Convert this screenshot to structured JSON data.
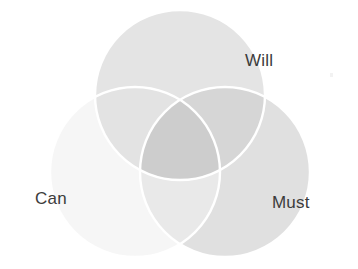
{
  "figure": {
    "kind": "venn-diagram",
    "set_count": 3,
    "background_color": "#ffffff",
    "label_color": "#3c3c3c",
    "separator_color": "#ffffff"
  },
  "chart_data": {
    "type": "venn",
    "title": "",
    "subtitle": "",
    "xlabel": "",
    "ylabel": "",
    "legend_position": "none",
    "grid": false,
    "sets": [
      {
        "id": "will",
        "label": "Will",
        "fill": "#e4e4e4",
        "cx": 180,
        "cy": 95,
        "r": 85,
        "label_position": "top-right"
      },
      {
        "id": "can",
        "label": "Can",
        "fill": "#f6f6f6",
        "cx": 135,
        "cy": 172,
        "r": 85,
        "label_position": "left"
      },
      {
        "id": "must",
        "label": "Must",
        "fill": "#e0e0e0",
        "cx": 225,
        "cy": 172,
        "r": 85,
        "label_position": "right"
      }
    ],
    "regions": [
      {
        "id": "will-only",
        "sets": [
          "Will"
        ],
        "fill": "#e4e4e4"
      },
      {
        "id": "can-only",
        "sets": [
          "Can"
        ],
        "fill": "#f6f6f6"
      },
      {
        "id": "must-only",
        "sets": [
          "Must"
        ],
        "fill": "#e0e0e0"
      },
      {
        "id": "will-can",
        "sets": [
          "Will",
          "Can"
        ],
        "fill": "#e3e3e3"
      },
      {
        "id": "will-must",
        "sets": [
          "Will",
          "Must"
        ],
        "fill": "#d6d6d6"
      },
      {
        "id": "can-must",
        "sets": [
          "Can",
          "Must"
        ],
        "fill": "#e9e9e9"
      },
      {
        "id": "will-can-must",
        "sets": [
          "Will",
          "Can",
          "Must"
        ],
        "fill": "#cdcdcd"
      }
    ]
  },
  "labels": {
    "will": "Will",
    "can": "Can",
    "must": "Must"
  }
}
